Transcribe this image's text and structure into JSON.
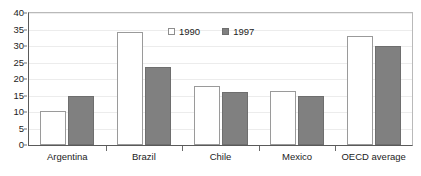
{
  "chart_data": {
    "type": "bar",
    "title": "",
    "subtitle": "",
    "xlabel": "",
    "ylabel": "",
    "categories": [
      "Argentina",
      "Brazil",
      "Chile",
      "Mexico",
      "OECD average"
    ],
    "series": [
      {
        "name": "1990",
        "values": [
          10.3,
          34.2,
          18.0,
          16.5,
          33.0
        ],
        "color": "#ffffff",
        "edge_color": "#9a9a9a"
      },
      {
        "name": "1997",
        "values": [
          15.0,
          23.7,
          16.0,
          14.8,
          30.0
        ],
        "color": "#808080",
        "edge_color": "#6e6e6e"
      }
    ],
    "ylim": [
      0,
      40
    ],
    "yticks": [
      0,
      5,
      10,
      15,
      20,
      25,
      30,
      35,
      40
    ],
    "ytick_labels": [
      "0",
      "5",
      "10",
      "15",
      "20",
      "25",
      "30",
      "35",
      "40"
    ],
    "grid": true,
    "grid_axis": "y",
    "legend": [
      "1990",
      "1997"
    ],
    "legend_position": "upper center"
  },
  "legend": {
    "items": [
      {
        "label": "1990",
        "swatch": "open-square-swatch"
      },
      {
        "label": "1997",
        "swatch": "filled-square-swatch"
      }
    ]
  },
  "axes": {
    "y_tick_labels": [
      "40",
      "35",
      "30",
      "25",
      "20",
      "15",
      "10",
      "5",
      "0"
    ],
    "x_tick_labels": [
      "Argentina",
      "Brazil",
      "Chile",
      "Mexico",
      "OECD average"
    ]
  }
}
